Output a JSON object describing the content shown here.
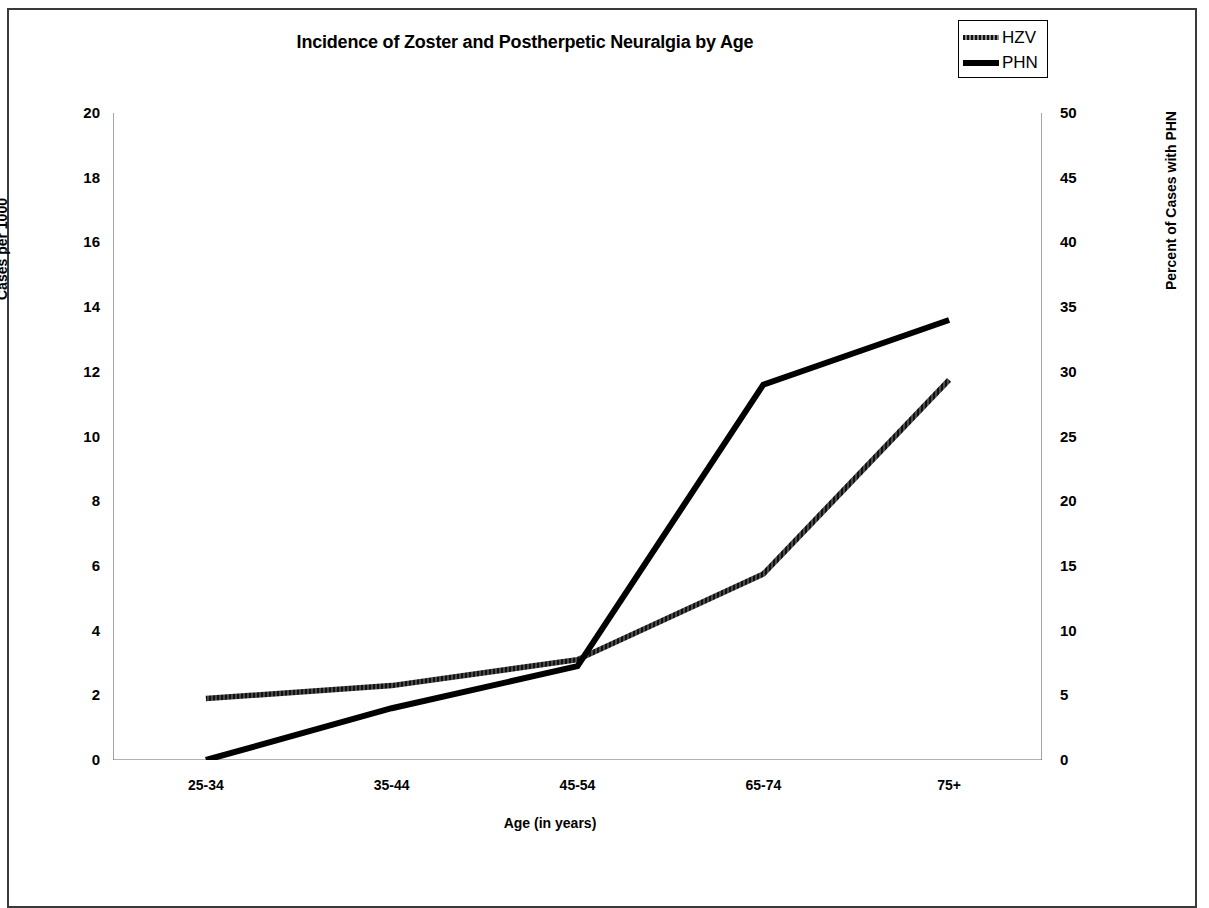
{
  "chart_data": {
    "type": "line",
    "title": "Incidence of Zoster and Postherpetic Neuralgia by Age",
    "xlabel": "Age (in years)",
    "ylabel": "Cases per 1000",
    "ylabel_right": "Percent of Cases with PHN",
    "categories": [
      "25-34",
      "35-44",
      "45-54",
      "65-74",
      "75+"
    ],
    "grid": false,
    "legend_position": "top-right",
    "ylim": [
      0,
      20
    ],
    "ylim_right": [
      0,
      50
    ],
    "yticks": [
      "0",
      "2",
      "4",
      "6",
      "8",
      "10",
      "12",
      "14",
      "16",
      "18",
      "20"
    ],
    "yticks_right": [
      "0",
      "5",
      "10",
      "15",
      "20",
      "25",
      "30",
      "35",
      "40",
      "45",
      "50"
    ],
    "series": [
      {
        "name": "HZV",
        "axis": "left",
        "color": "#3d3d3d",
        "style": "textured",
        "values": [
          1.9,
          2.3,
          3.1,
          5.75,
          11.75
        ]
      },
      {
        "name": "PHN",
        "axis": "right",
        "color": "#000000",
        "style": "solid",
        "values": [
          0,
          4,
          7.25,
          29,
          34
        ]
      }
    ]
  },
  "legend": {
    "items": [
      {
        "label": "HZV",
        "swatch": "hzv-line-swatch"
      },
      {
        "label": "PHN",
        "swatch": "phn-line-swatch"
      }
    ]
  }
}
